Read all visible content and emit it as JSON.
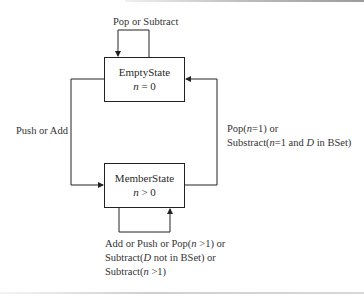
{
  "diagram": {
    "type": "state-diagram",
    "states": [
      {
        "id": "empty",
        "name": "EmptyState",
        "condition_var": "n",
        "condition_op": " = ",
        "condition_val": "0"
      },
      {
        "id": "member",
        "name": "MemberState",
        "condition_var": "n",
        "condition_op": " > ",
        "condition_val": "0"
      }
    ],
    "transitions": {
      "empty_self": {
        "label": "Pop or Subtract"
      },
      "empty_to_member": {
        "label": "Push or Add"
      },
      "member_to_empty": {
        "line1_a": "Pop(",
        "line1_var": "n",
        "line1_b": "=1) or",
        "line2_a": "Substract(",
        "line2_var": "n",
        "line2_b": "=1 and ",
        "line2_var2": "D",
        "line2_c": " in BSet)"
      },
      "member_self": {
        "line1_a": "Add or Push or Pop(",
        "line1_var": "n",
        "line1_b": " >1) or",
        "line2_a": "Subtract(",
        "line2_var": "D",
        "line2_b": " not in BSet) or",
        "line3_a": "Subtract(",
        "line3_var": "n",
        "line3_b": " >1)"
      }
    },
    "colors": {
      "line": "#222222",
      "text": "#2a2a2a",
      "background": "#ffffff"
    }
  }
}
